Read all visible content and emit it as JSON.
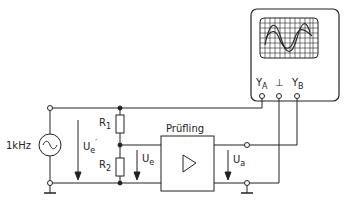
{
  "diagram": {
    "source": {
      "label": "1kHz",
      "symbol": "~"
    },
    "resistors": [
      {
        "name": "R",
        "sub": "1"
      },
      {
        "name": "R",
        "sub": "2"
      }
    ],
    "dut": {
      "label": "Prüfling"
    },
    "voltages": {
      "ue_prime": {
        "name": "U",
        "sub": "e",
        "sup": "′"
      },
      "ue": {
        "name": "U",
        "sub": "e"
      },
      "ua": {
        "name": "U",
        "sub": "a"
      }
    },
    "oscilloscope": {
      "inputs": [
        {
          "name": "Y",
          "sub": "A"
        },
        {
          "name": "⊥",
          "sub": ""
        },
        {
          "name": "Y",
          "sub": "B"
        }
      ]
    },
    "colors": {
      "line": "#222222",
      "background": "#ffffff"
    }
  }
}
